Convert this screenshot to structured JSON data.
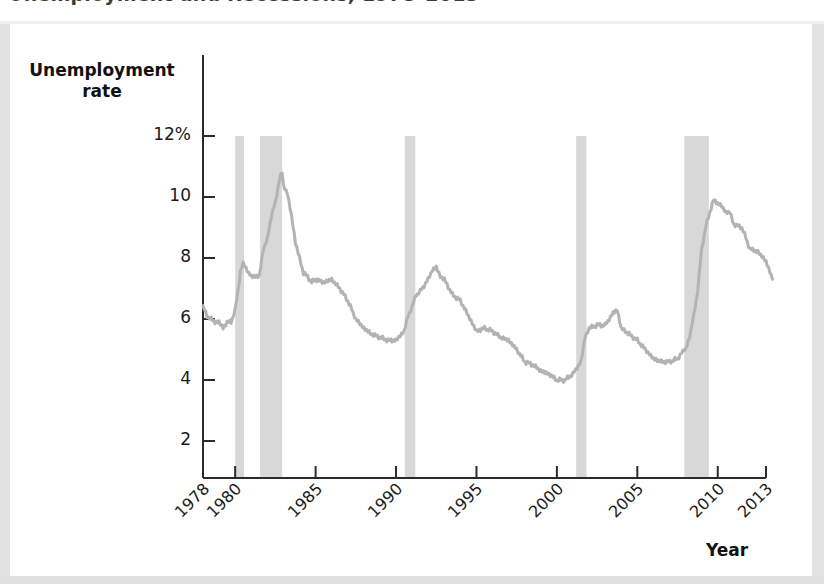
{
  "figure": {
    "title": "Unemployment and Recessions, 1978–2013",
    "background_color": "#ffffff",
    "page_margin_color": "#dedede"
  },
  "axes": {
    "y_title_line1": "Unemployment",
    "y_title_line2": "rate",
    "x_title": "Year",
    "y_ticks": [
      "12%",
      "10",
      "8",
      "6",
      "4",
      "2"
    ],
    "x_ticks": [
      "1978",
      "1980",
      "1985",
      "1990",
      "1995",
      "2000",
      "2005",
      "2010",
      "2013"
    ],
    "axis_color": "#2b2b2b"
  },
  "chart_data": {
    "type": "line",
    "title": "Unemployment and Recessions, 1978–2013",
    "xlabel": "Year",
    "ylabel": "Unemployment rate",
    "xlim": [
      1978,
      2013
    ],
    "ylim": [
      0,
      12
    ],
    "y_tick_values": [
      2,
      4,
      6,
      8,
      10,
      12
    ],
    "y_tick_labels": [
      "2",
      "4",
      "6",
      "8",
      "10",
      "12%"
    ],
    "x_tick_values": [
      1978,
      1980,
      1985,
      1990,
      1995,
      2000,
      2005,
      2010,
      2013
    ],
    "grid": false,
    "legend": null,
    "line_color": "#b3b3b3",
    "line_width": 3,
    "shaded_band_color": "#d8d8d8",
    "shaded_band_label": "Recessions",
    "recessions": [
      {
        "start": 1980.0,
        "end": 1980.55
      },
      {
        "start": 1981.55,
        "end": 1982.92
      },
      {
        "start": 1990.54,
        "end": 1991.2
      },
      {
        "start": 2001.2,
        "end": 2001.84
      },
      {
        "start": 2007.92,
        "end": 2009.45
      }
    ],
    "series": [
      {
        "name": "Unemployment rate",
        "x": [
          1978.0,
          1978.25,
          1978.5,
          1978.75,
          1979.0,
          1979.25,
          1979.5,
          1979.75,
          1980.0,
          1980.17,
          1980.33,
          1980.5,
          1980.67,
          1980.83,
          1981.0,
          1981.25,
          1981.5,
          1981.75,
          1982.0,
          1982.25,
          1982.5,
          1982.75,
          1982.92,
          1983.0,
          1983.25,
          1983.5,
          1983.75,
          1984.0,
          1984.25,
          1984.5,
          1984.75,
          1985.0,
          1985.5,
          1986.0,
          1986.5,
          1987.0,
          1987.5,
          1988.0,
          1988.5,
          1989.0,
          1989.5,
          1990.0,
          1990.5,
          1990.75,
          1991.0,
          1991.25,
          1991.5,
          1991.75,
          1992.0,
          1992.25,
          1992.5,
          1992.75,
          1993.0,
          1993.5,
          1994.0,
          1994.5,
          1995.0,
          1995.5,
          1996.0,
          1996.5,
          1997.0,
          1997.5,
          1998.0,
          1998.5,
          1999.0,
          1999.5,
          2000.0,
          2000.5,
          2001.0,
          2001.25,
          2001.5,
          2001.75,
          2002.0,
          2002.5,
          2003.0,
          2003.5,
          2003.75,
          2004.0,
          2004.5,
          2005.0,
          2005.5,
          2006.0,
          2006.5,
          2007.0,
          2007.5,
          2007.92,
          2008.0,
          2008.25,
          2008.5,
          2008.75,
          2009.0,
          2009.25,
          2009.5,
          2009.75,
          2010.0,
          2010.25,
          2010.5,
          2010.75,
          2011.0,
          2011.5,
          2012.0,
          2012.5,
          2013.0,
          2013.4
        ],
        "y": [
          6.4,
          6.1,
          6.0,
          5.9,
          5.9,
          5.7,
          5.9,
          5.9,
          6.3,
          6.9,
          7.6,
          7.8,
          7.7,
          7.5,
          7.4,
          7.4,
          7.4,
          8.3,
          8.6,
          9.4,
          9.8,
          10.6,
          10.8,
          10.4,
          10.1,
          9.4,
          8.5,
          8.0,
          7.5,
          7.4,
          7.2,
          7.3,
          7.2,
          7.3,
          7.0,
          6.6,
          6.0,
          5.7,
          5.5,
          5.4,
          5.3,
          5.3,
          5.6,
          6.1,
          6.4,
          6.8,
          6.9,
          7.1,
          7.3,
          7.6,
          7.7,
          7.4,
          7.3,
          6.8,
          6.6,
          6.1,
          5.6,
          5.7,
          5.6,
          5.4,
          5.3,
          5.0,
          4.6,
          4.5,
          4.3,
          4.2,
          4.0,
          4.0,
          4.2,
          4.4,
          4.6,
          5.4,
          5.7,
          5.8,
          5.8,
          6.2,
          6.3,
          5.7,
          5.5,
          5.3,
          5.0,
          4.7,
          4.6,
          4.6,
          4.7,
          5.0,
          5.0,
          5.4,
          6.1,
          6.9,
          8.3,
          9.0,
          9.5,
          9.9,
          9.8,
          9.7,
          9.5,
          9.5,
          9.1,
          9.0,
          8.3,
          8.2,
          7.9,
          7.3
        ]
      }
    ]
  }
}
